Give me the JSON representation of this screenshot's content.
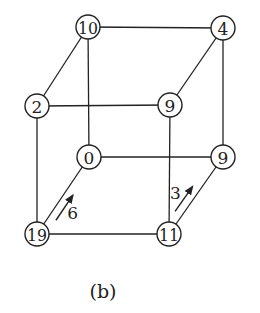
{
  "diagram": {
    "type": "cube-graph",
    "caption": "(b)",
    "nodes": [
      {
        "id": "back-top-left",
        "label": "10",
        "x": 88,
        "y": 27
      },
      {
        "id": "back-top-right",
        "label": "4",
        "x": 223,
        "y": 28
      },
      {
        "id": "front-top-left",
        "label": "2",
        "x": 37,
        "y": 106
      },
      {
        "id": "front-top-right",
        "label": "9",
        "x": 170,
        "y": 105
      },
      {
        "id": "back-bottom-left",
        "label": "0",
        "x": 89,
        "y": 157
      },
      {
        "id": "back-bottom-right",
        "label": "9",
        "x": 223,
        "y": 157
      },
      {
        "id": "front-bottom-left",
        "label": "19",
        "x": 37,
        "y": 234
      },
      {
        "id": "front-bottom-right",
        "label": "11",
        "x": 169,
        "y": 234
      }
    ],
    "edges": [
      [
        "back-top-left",
        "back-top-right"
      ],
      [
        "back-top-left",
        "front-top-left"
      ],
      [
        "back-top-left",
        "back-bottom-left"
      ],
      [
        "back-top-right",
        "front-top-right"
      ],
      [
        "back-top-right",
        "back-bottom-right"
      ],
      [
        "front-top-left",
        "front-top-right"
      ],
      [
        "front-top-left",
        "front-bottom-left"
      ],
      [
        "front-top-right",
        "front-bottom-right"
      ],
      [
        "back-bottom-left",
        "back-bottom-right"
      ],
      [
        "back-bottom-left",
        "front-bottom-left"
      ],
      [
        "back-bottom-right",
        "front-bottom-right"
      ],
      [
        "front-bottom-left",
        "front-bottom-right"
      ]
    ],
    "arrows": [
      {
        "from": "front-bottom-left",
        "to": "back-bottom-left",
        "label": "6"
      },
      {
        "from": "front-bottom-right",
        "to": "back-bottom-right",
        "label": "3"
      }
    ]
  }
}
